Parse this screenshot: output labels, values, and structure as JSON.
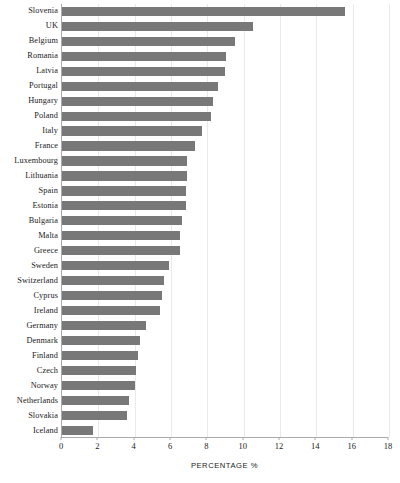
{
  "chart_data": {
    "type": "bar",
    "orientation": "horizontal",
    "title": "",
    "xlabel": "PERCENTAGE %",
    "ylabel": "",
    "xlim": [
      0,
      18
    ],
    "xticks": [
      0,
      2,
      4,
      6,
      8,
      10,
      12,
      14,
      16,
      18
    ],
    "grid": true,
    "legend": null,
    "bar_color": "#787878",
    "categories": [
      "Slovenia",
      "UK",
      "Belgium",
      "Romania",
      "Latvia",
      "Portugal",
      "Hungary",
      "Poland",
      "Italy",
      "France",
      "Luxembourg",
      "Lithuania",
      "Spain",
      "Estonia",
      "Bulgaria",
      "Malta",
      "Greece",
      "Sweden",
      "Switzerland",
      "Cyprus",
      "Ireland",
      "Germany",
      "Denmark",
      "Finland",
      "Czech",
      "Norway",
      "Netherlands",
      "Slovakia",
      "Iceland"
    ],
    "values": [
      15.6,
      10.5,
      9.5,
      9.0,
      8.95,
      8.6,
      8.3,
      8.2,
      7.7,
      7.3,
      6.9,
      6.9,
      6.8,
      6.8,
      6.6,
      6.5,
      6.5,
      5.9,
      5.6,
      5.5,
      5.4,
      4.6,
      4.3,
      4.2,
      4.1,
      4.0,
      3.7,
      3.6,
      1.7
    ]
  }
}
